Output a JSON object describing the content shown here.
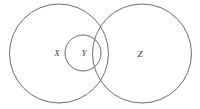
{
  "figure": {
    "type": "venn-diagram",
    "background_color": "#ffffff",
    "stroke_color": "#5b5b5b",
    "label_color": "#3a3a3a",
    "width": 200,
    "height": 109
  },
  "circles": [
    {
      "id": "X",
      "label": "X",
      "cx": 59,
      "cy": 53.5,
      "r": 49.5,
      "label_x": 57,
      "label_y": 54
    },
    {
      "id": "Y",
      "label": "Y",
      "cx": 83,
      "cy": 53,
      "r": 18,
      "label_x": 84,
      "label_y": 54
    },
    {
      "id": "Z",
      "label": "Z",
      "cx": 142,
      "cy": 53.5,
      "r": 49.5,
      "label_x": 140,
      "label_y": 55
    }
  ]
}
